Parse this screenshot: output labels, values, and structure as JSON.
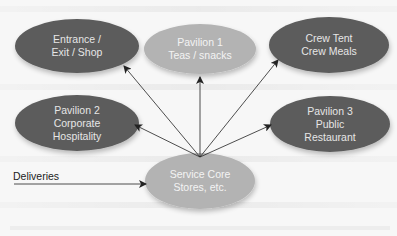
{
  "diagram": {
    "type": "hub-and-spoke flow diagram",
    "colors": {
      "background": "#f7f7f7",
      "dark_node": "#5c5c5c",
      "light_node": "#b3b3b3",
      "dark_node_text": "#e6e6e6",
      "light_node_text": "#f3f3f3",
      "arrow": "#222222"
    },
    "hub": {
      "id": "service-core",
      "lines": [
        "Service Core",
        "Stores, etc."
      ],
      "style": "light"
    },
    "nodes": [
      {
        "id": "entrance",
        "lines": [
          "Entrance /",
          "Exit / Shop"
        ],
        "style": "dark"
      },
      {
        "id": "pavilion-1",
        "lines": [
          "Pavilion 1",
          "Teas / snacks"
        ],
        "style": "light"
      },
      {
        "id": "crew-tent",
        "lines": [
          "Crew Tent",
          "Crew Meals"
        ],
        "style": "dark"
      },
      {
        "id": "pavilion-2",
        "lines": [
          "Pavilion 2",
          "Corporate",
          "Hospitality"
        ],
        "style": "dark"
      },
      {
        "id": "pavilion-3",
        "lines": [
          "Pavilion 3",
          "Public",
          "Restaurant"
        ],
        "style": "dark"
      }
    ],
    "edges": [
      {
        "from": "service-core",
        "to": "entrance"
      },
      {
        "from": "service-core",
        "to": "pavilion-1"
      },
      {
        "from": "service-core",
        "to": "crew-tent"
      },
      {
        "from": "service-core",
        "to": "pavilion-2"
      },
      {
        "from": "service-core",
        "to": "pavilion-3"
      },
      {
        "from": "deliveries",
        "to": "service-core"
      }
    ],
    "input": {
      "label": "Deliveries"
    }
  }
}
